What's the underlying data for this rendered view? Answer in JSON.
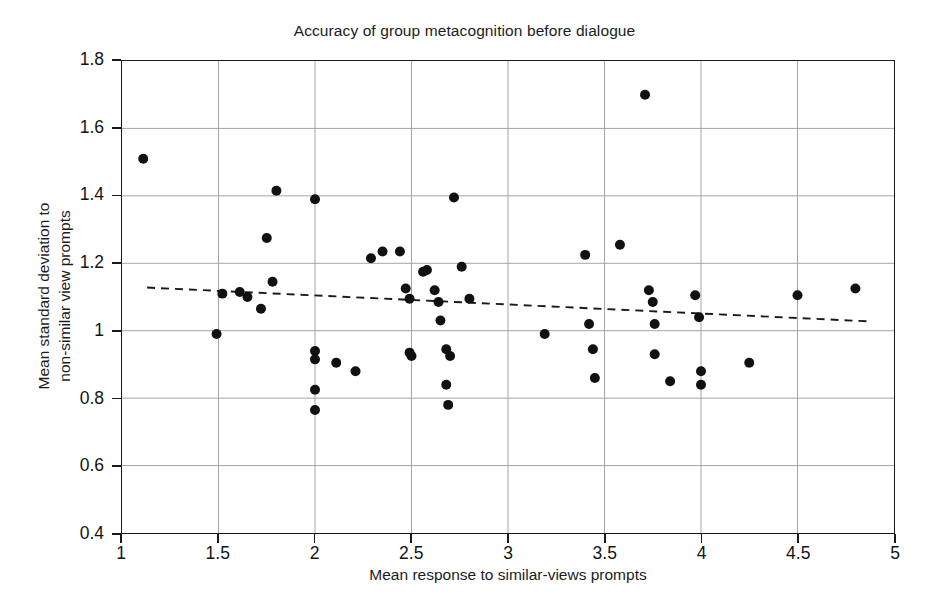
{
  "chart_data": {
    "type": "scatter",
    "title": "Accuracy of group metacognition before dialogue",
    "xlabel": "Mean response to similar-views prompts",
    "ylabel_line1": "Mean standard deviation to",
    "ylabel_line2": "non-similar view prompts",
    "xlim": [
      1,
      5
    ],
    "ylim": [
      0.4,
      1.8
    ],
    "xticks": [
      1,
      1.5,
      2,
      2.5,
      3,
      3.5,
      4,
      4.5,
      5
    ],
    "xtick_labels": [
      "1",
      "1.5",
      "2",
      "2.5",
      "3",
      "3.5",
      "4",
      "4.5",
      "5"
    ],
    "yticks": [
      0.4,
      0.6,
      0.8,
      1.0,
      1.2,
      1.4,
      1.6,
      1.8
    ],
    "ytick_labels": [
      "0.4",
      "0.6",
      "0.8",
      "1",
      "1.2",
      "1.4",
      "1.6",
      "1.8"
    ],
    "grid": true,
    "grid_color": "#9a9a9a",
    "point_color": "#111111",
    "point_radius": 5,
    "legend": null,
    "series": [
      {
        "name": "groups",
        "marker": "filled-circle",
        "points": [
          [
            1.11,
            1.51
          ],
          [
            1.49,
            0.99
          ],
          [
            1.52,
            1.11
          ],
          [
            1.61,
            1.115
          ],
          [
            1.65,
            1.1
          ],
          [
            1.72,
            1.065
          ],
          [
            1.75,
            1.275
          ],
          [
            1.78,
            1.145
          ],
          [
            1.8,
            1.415
          ],
          [
            2.0,
            1.39
          ],
          [
            2.0,
            0.94
          ],
          [
            2.0,
            0.915
          ],
          [
            2.0,
            0.825
          ],
          [
            2.0,
            0.765
          ],
          [
            2.11,
            0.905
          ],
          [
            2.21,
            0.88
          ],
          [
            2.29,
            1.215
          ],
          [
            2.35,
            1.235
          ],
          [
            2.44,
            1.235
          ],
          [
            2.47,
            1.125
          ],
          [
            2.49,
            1.095
          ],
          [
            2.49,
            0.935
          ],
          [
            2.5,
            0.925
          ],
          [
            2.56,
            1.175
          ],
          [
            2.58,
            1.18
          ],
          [
            2.62,
            1.12
          ],
          [
            2.64,
            1.085
          ],
          [
            2.65,
            1.03
          ],
          [
            2.68,
            0.945
          ],
          [
            2.7,
            0.925
          ],
          [
            2.68,
            0.84
          ],
          [
            2.69,
            0.78
          ],
          [
            2.72,
            1.395
          ],
          [
            2.76,
            1.19
          ],
          [
            2.8,
            1.095
          ],
          [
            3.19,
            0.99
          ],
          [
            3.4,
            1.225
          ],
          [
            3.42,
            1.02
          ],
          [
            3.44,
            0.945
          ],
          [
            3.45,
            0.86
          ],
          [
            3.58,
            1.255
          ],
          [
            3.71,
            1.7
          ],
          [
            3.73,
            1.12
          ],
          [
            3.75,
            1.085
          ],
          [
            3.76,
            1.02
          ],
          [
            3.76,
            0.93
          ],
          [
            3.84,
            0.85
          ],
          [
            3.97,
            1.105
          ],
          [
            3.99,
            1.04
          ],
          [
            4.0,
            0.88
          ],
          [
            4.0,
            0.84
          ],
          [
            4.25,
            0.905
          ],
          [
            4.5,
            1.105
          ],
          [
            4.8,
            1.125
          ]
        ]
      }
    ],
    "trendline": {
      "style": "dashed",
      "color": "#1a1a1a",
      "x_start": 1.13,
      "y_start": 1.128,
      "x_end": 4.86,
      "y_end": 1.028
    }
  }
}
